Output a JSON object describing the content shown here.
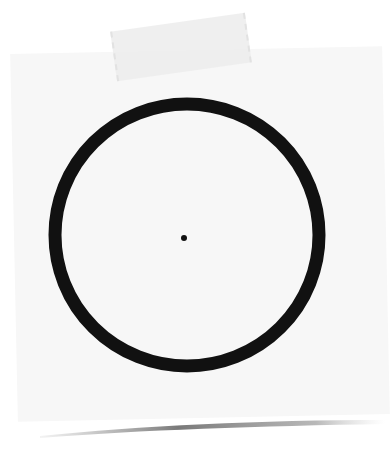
{
  "scene": {
    "description": "Sticky note with hand-drawn circle and center dot, held by tape",
    "colors": {
      "background": "#ffffff",
      "paper": "#f7f7f7",
      "ink": "#111111",
      "tape": "#ececec",
      "shadow": "#8a8a8a"
    },
    "circle": {
      "cx": 187,
      "cy": 235,
      "r": 132,
      "stroke_width": 13
    },
    "dot": {
      "cx": 184,
      "cy": 238,
      "r": 3
    }
  }
}
